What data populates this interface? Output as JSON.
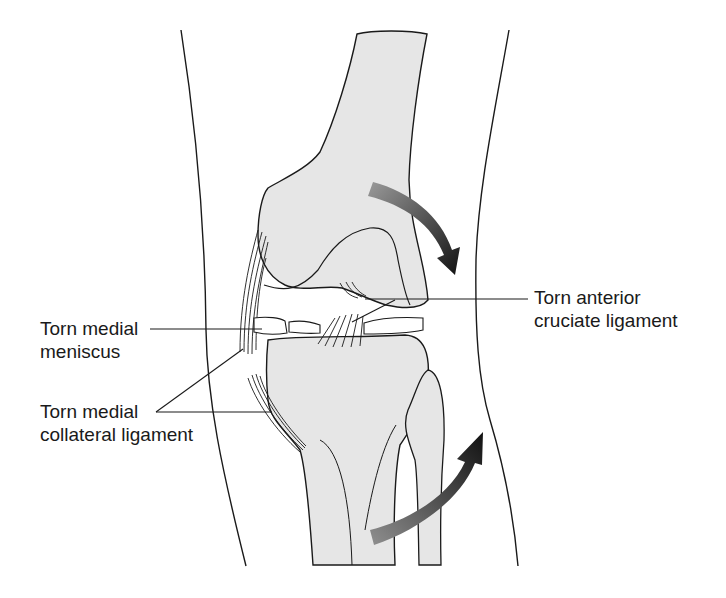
{
  "figure": {
    "labels": {
      "meniscus": {
        "line1": "Torn medial",
        "line2": "meniscus"
      },
      "mcl": {
        "line1": "Torn medial",
        "line2": "collateral ligament"
      },
      "acl": {
        "line1": "Torn anterior",
        "line2": "cruciate ligament"
      }
    },
    "arrows": [
      {
        "name": "femur-rotation-arrow",
        "direction": "clockwise-down"
      },
      {
        "name": "tibia-rotation-arrow",
        "direction": "upward-right"
      }
    ],
    "colors": {
      "bone_fill": "#e6e6e6",
      "outline": "#1a1a1a",
      "arrow_dark": "#111111",
      "arrow_light": "#8a8a8a"
    }
  }
}
